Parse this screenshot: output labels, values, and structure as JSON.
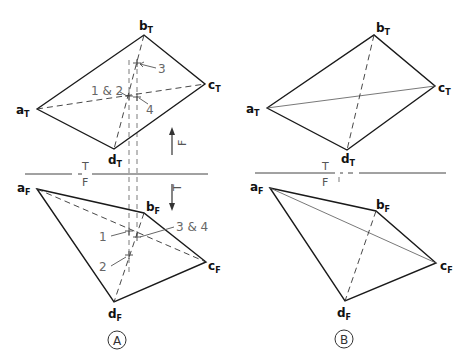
{
  "figure": {
    "panels": [
      {
        "id": "A",
        "caption": "A",
        "top_view": {
          "vertices": {
            "a": {
              "label": "a",
              "sub": "T",
              "x": 37,
              "y": 109
            },
            "b": {
              "label": "b",
              "sub": "T",
              "x": 144,
              "y": 35
            },
            "c": {
              "label": "c",
              "sub": "T",
              "x": 205,
              "y": 84
            },
            "d": {
              "label": "d",
              "sub": "T",
              "x": 114,
              "y": 149
            }
          },
          "point_labels": {
            "p12": "1 & 2",
            "p3": "3",
            "p4": "4"
          },
          "arrow_label": "F"
        },
        "fold_line": {
          "top_label": "T",
          "bottom_label": "F"
        },
        "front_view": {
          "vertices": {
            "a": {
              "label": "a",
              "sub": "F",
              "x": 37,
              "y": 189
            },
            "b": {
              "label": "b",
              "sub": "F",
              "x": 144,
              "y": 213
            },
            "c": {
              "label": "c",
              "sub": "F",
              "x": 206,
              "y": 262
            },
            "d": {
              "label": "d",
              "sub": "F",
              "x": 114,
              "y": 302
            }
          },
          "point_labels": {
            "p1": "1",
            "p2": "2",
            "p34": "3 & 4"
          },
          "arrow_label": "T"
        }
      },
      {
        "id": "B",
        "caption": "B",
        "top_view": {
          "vertices": {
            "a": {
              "label": "a",
              "sub": "T",
              "x": 267,
              "y": 108
            },
            "b": {
              "label": "b",
              "sub": "T",
              "x": 374,
              "y": 35
            },
            "c": {
              "label": "c",
              "sub": "T",
              "x": 435,
              "y": 86
            },
            "d": {
              "label": "d",
              "sub": "T",
              "x": 347,
              "y": 150
            }
          }
        },
        "fold_line": {
          "top_label": "T",
          "bottom_label": "F"
        },
        "front_view": {
          "vertices": {
            "a": {
              "label": "a",
              "sub": "F",
              "x": 270,
              "y": 188
            },
            "b": {
              "label": "b",
              "sub": "F",
              "x": 376,
              "y": 211
            },
            "c": {
              "label": "c",
              "sub": "F",
              "x": 436,
              "y": 263
            },
            "d": {
              "label": "d",
              "sub": "F",
              "x": 345,
              "y": 301
            }
          }
        }
      }
    ]
  }
}
